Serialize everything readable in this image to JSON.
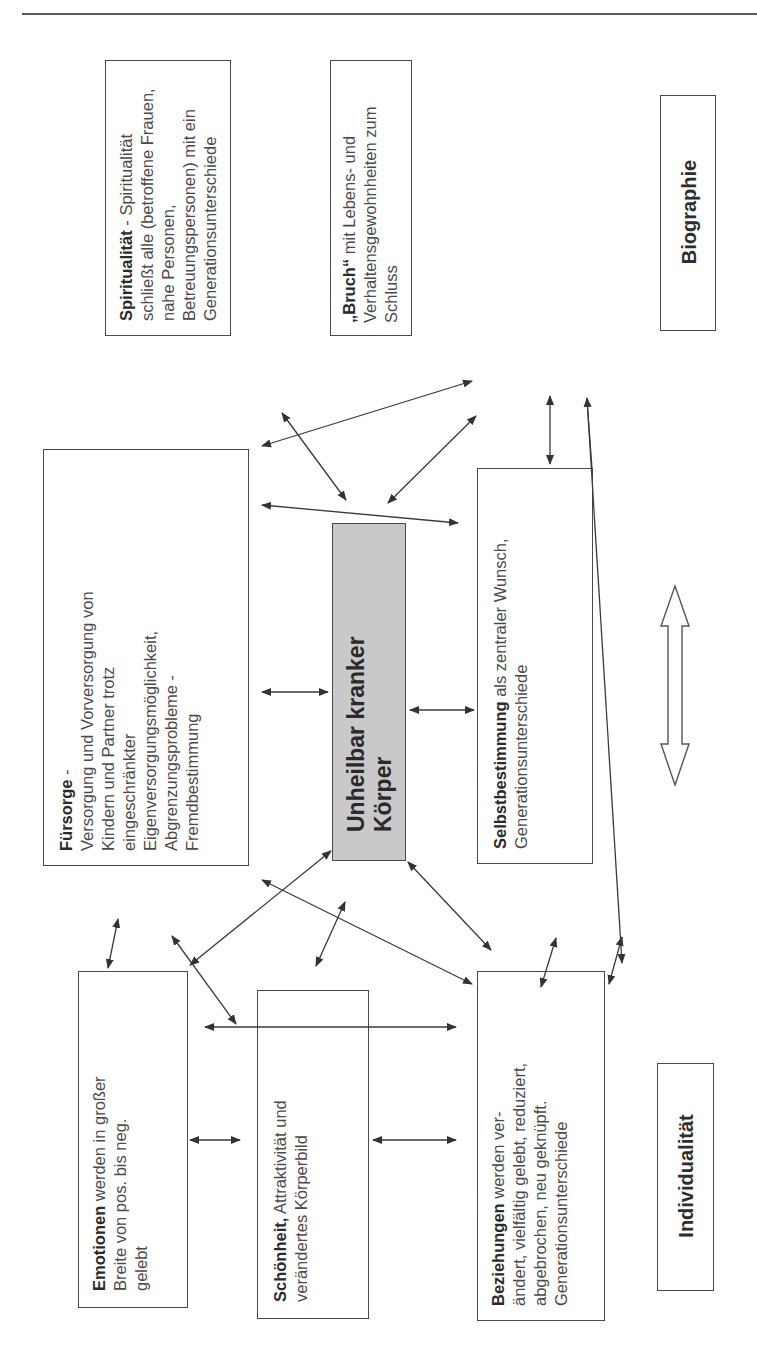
{
  "diagram": {
    "orientation": "rotated -90deg (text reads bottom-to-top)",
    "center": {
      "title_line1": "Unheilbar kranker",
      "title_line2": "Körper",
      "fill_color": "#c9c9c9"
    },
    "axis_labels": {
      "top": "Biographie",
      "bottom": "Individualität"
    },
    "boxes": {
      "spiritualitaet": {
        "bold": "Spiritualität",
        "lines": [
          " - Spiritualität",
          "schließt alle (betroffene Frauen,",
          "nahe Personen,",
          "Betreuungspersonen) mit ein",
          "Generationsunterschiede"
        ]
      },
      "bruch": {
        "bold": "„Bruch“",
        "lines": [
          " mit Lebens- und",
          "Verhaltensgewohnheiten zum",
          "Schluss"
        ]
      },
      "fuersorge": {
        "bold": "Fürsorge",
        "lines": [
          " -",
          "Versorgung und Vorversorgung von",
          "Kindern und Partner trotz",
          "eingeschränkter",
          "Eigenversorgungsmöglichkeit,",
          "Abgrenzungsprobleme -",
          "Fremdbestimmung"
        ]
      },
      "selbstbestimmung": {
        "bold": "Selbstbestimmung",
        "lines": [
          " als zentraler Wunsch,",
          "Generationsunterschiede"
        ]
      },
      "emotionen": {
        "bold": "Emotionen",
        "lines": [
          " werden in großer",
          "Breite von pos. bis neg.",
          "gelebt"
        ]
      },
      "schoenheit": {
        "bold": "Schönheit,",
        "lines": [
          " Attraktivität und",
          "verändertes Körperbild"
        ]
      },
      "beziehungen": {
        "bold": "Beziehungen",
        "lines": [
          " werden ver-",
          "ändert, vielfältig gelebt, reduziert,",
          "abgebrochen, neu geknüpft.",
          "Generationsunterschiede"
        ]
      }
    },
    "connector_color": "#3a3a3a"
  }
}
